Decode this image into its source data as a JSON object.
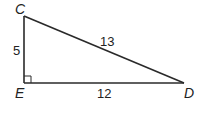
{
  "diagram": {
    "type": "right-triangle",
    "vertices": {
      "C": {
        "label": "C",
        "x": 24,
        "y": 16
      },
      "E": {
        "label": "E",
        "x": 24,
        "y": 83
      },
      "D": {
        "label": "D",
        "x": 184,
        "y": 83
      }
    },
    "sides": {
      "CE": {
        "label": "5"
      },
      "CD": {
        "label": "13"
      },
      "ED": {
        "label": "12"
      }
    },
    "right_angle_at": "E"
  },
  "colors": {
    "line": "#2a2a2a",
    "text": "#222222",
    "background": "#ffffff"
  }
}
